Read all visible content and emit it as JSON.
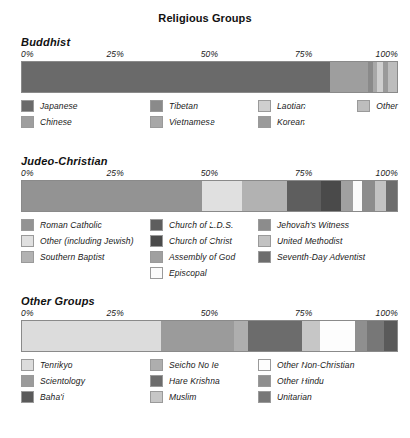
{
  "title": "Religious Groups",
  "axis": {
    "ticks": [
      "0%",
      "25%",
      "50%",
      "75%",
      "100%"
    ]
  },
  "chart_data": [
    {
      "type": "bar",
      "title": "Buddhist",
      "orientation": "horizontal",
      "stacked": true,
      "normalized": "100%",
      "xlabel": "",
      "ylabel": "",
      "xlim": [
        0,
        100
      ],
      "grid": true,
      "legend_position": "below",
      "categories": [
        "Japanese",
        "Chinese",
        "Tibetan",
        "Vietnamese",
        "Laotian",
        "Korean",
        "Other"
      ],
      "values": [
        82.0,
        10.3,
        1.3,
        1.1,
        1.6,
        1.3,
        2.4
      ],
      "colors": [
        "#6a6a6a",
        "#9e9e9e",
        "#8a8a8a",
        "#a8a8a8",
        "#cfcfcf",
        "#9a9a9a",
        "#bdbdbd"
      ],
      "legend_columns": [
        [
          "Japanese",
          "Chinese"
        ],
        [
          "Tibetan",
          "Vietnamese"
        ],
        [
          "Laotian",
          "Korean"
        ],
        [
          "Other"
        ]
      ]
    },
    {
      "type": "bar",
      "title": "Judeo-Christian",
      "orientation": "horizontal",
      "stacked": true,
      "normalized": "100%",
      "xlabel": "",
      "ylabel": "",
      "xlim": [
        0,
        100
      ],
      "grid": true,
      "legend_position": "below",
      "categories": [
        "Roman Catholic",
        "Other (including Jewish)",
        "Southern Baptist",
        "Church of L.D.S.",
        "Church of Christ",
        "Assembly of God",
        "Episcopal",
        "Jehovah's Witness",
        "United Methodist",
        "Seventh-Day Adventist"
      ],
      "values": [
        48.0,
        10.6,
        12.2,
        9.0,
        5.3,
        3.2,
        2.4,
        3.4,
        2.9,
        3.0
      ],
      "colors": [
        "#939393",
        "#e0e0e0",
        "#b2b2b2",
        "#5e5e5e",
        "#4a4a4a",
        "#a0a0a0",
        "#fbfbfb",
        "#8c8c8c",
        "#c2c2c2",
        "#6d6d6d"
      ],
      "legend_columns": [
        [
          "Roman Catholic",
          "Other (including Jewish)",
          "Southern Baptist"
        ],
        [
          "Church of L.D.S.",
          "Church of Christ",
          "Assembly of God",
          "Episcopal"
        ],
        [
          "Jehovah's Witness",
          "United Methodist",
          "Seventh-Day Adventist"
        ]
      ]
    },
    {
      "type": "bar",
      "title": "Other Groups",
      "orientation": "horizontal",
      "stacked": true,
      "normalized": "100%",
      "xlabel": "",
      "ylabel": "",
      "xlim": [
        0,
        100
      ],
      "grid": true,
      "legend_position": "below",
      "categories": [
        "Tenrikyo",
        "Scientology",
        "Seicho No Ie",
        "Hare Krishna",
        "Muslim",
        "Other Non-Christian",
        "Other Hindu",
        "Unitarian",
        "Baha'i"
      ],
      "values": [
        37.0,
        19.6,
        3.7,
        14.3,
        4.8,
        9.3,
        3.4,
        4.5,
        3.4
      ],
      "colors": [
        "#dcdcdc",
        "#9b9b9b",
        "#aeaeae",
        "#6c6c6c",
        "#c6c6c6",
        "#fdfdfd",
        "#8f8f8f",
        "#777777",
        "#5a5a5a"
      ],
      "legend_columns": [
        [
          "Tenrikyo",
          "Scientology",
          "Baha'i"
        ],
        [
          "Seicho No Ie",
          "Hare Krishna",
          "Muslim"
        ],
        [
          "Other Non-Christian",
          "Other Hindu",
          "Unitarian"
        ]
      ]
    }
  ],
  "legends": {
    "buddhist": [
      {
        "label": "Japanese",
        "color": "#6a6a6a"
      },
      {
        "label": "Chinese",
        "color": "#9e9e9e"
      },
      {
        "label": "Tibetan",
        "color": "#8a8a8a"
      },
      {
        "label": "Vietnamese",
        "color": "#a8a8a8"
      },
      {
        "label": "Laotian",
        "color": "#cfcfcf"
      },
      {
        "label": "Korean",
        "color": "#9a9a9a"
      },
      {
        "label": "Other",
        "color": "#bdbdbd"
      }
    ],
    "judeo": [
      {
        "label": "Roman Catholic",
        "color": "#939393"
      },
      {
        "label": "Other (including Jewish)",
        "color": "#e0e0e0"
      },
      {
        "label": "Southern Baptist",
        "color": "#b2b2b2"
      },
      {
        "label": "Church of L.D.S.",
        "color": "#5e5e5e"
      },
      {
        "label": "Church of Christ",
        "color": "#4a4a4a"
      },
      {
        "label": "Assembly of God",
        "color": "#a0a0a0"
      },
      {
        "label": "Episcopal",
        "color": "#fbfbfb"
      },
      {
        "label": "Jehovah's Witness",
        "color": "#8c8c8c"
      },
      {
        "label": "United Methodist",
        "color": "#c2c2c2"
      },
      {
        "label": "Seventh-Day Adventist",
        "color": "#6d6d6d"
      }
    ],
    "other": [
      {
        "label": "Tenrikyo",
        "color": "#dcdcdc"
      },
      {
        "label": "Scientology",
        "color": "#9b9b9b"
      },
      {
        "label": "Baha'i",
        "color": "#5a5a5a"
      },
      {
        "label": "Seicho No Ie",
        "color": "#aeaeae"
      },
      {
        "label": "Hare Krishna",
        "color": "#6c6c6c"
      },
      {
        "label": "Muslim",
        "color": "#c6c6c6"
      },
      {
        "label": "Other Non-Christian",
        "color": "#fdfdfd"
      },
      {
        "label": "Other Hindu",
        "color": "#8f8f8f"
      },
      {
        "label": "Unitarian",
        "color": "#777777"
      }
    ]
  }
}
